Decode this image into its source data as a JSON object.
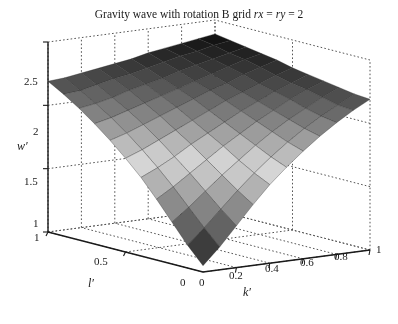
{
  "figure": {
    "width": 398,
    "height": 324,
    "background": "#ffffff",
    "title_prefix": "Gravity wave with rotation B grid ",
    "title_italic_1": "rx",
    "title_mid": " = ",
    "title_italic_2": "ry",
    "title_suffix": " = 2",
    "title_full": "Gravity wave with rotation B grid rx = ry = 2"
  },
  "chart_data": {
    "type": "surface",
    "title": "Gravity wave with rotation B grid rx = ry = 2",
    "xlabel": "k'",
    "ylabel": "l'",
    "zlabel": "w'",
    "grid": true,
    "colormap": "gray",
    "projection": "3d",
    "view": {
      "azimuth": -37.5,
      "elevation": 30
    },
    "xlim": [
      0,
      1
    ],
    "ylim": [
      0,
      1
    ],
    "zlim": [
      1,
      2.5
    ],
    "xticks": [
      0,
      0.2,
      0.4,
      0.6,
      0.8,
      1
    ],
    "xticklabels": [
      "0",
      "0.2",
      "0.4",
      "0.6",
      "0.8",
      "1"
    ],
    "yticks": [
      0,
      0.5,
      1
    ],
    "yticklabels": [
      "0",
      "0.5",
      "1"
    ],
    "zticks": [
      1,
      1.5,
      2,
      2.5
    ],
    "zticklabels": [
      "1",
      "1.5",
      "2",
      "2.5"
    ],
    "nx": 11,
    "ny": 11,
    "x": [
      0,
      0.1,
      0.2,
      0.3,
      0.4,
      0.5,
      0.6,
      0.7,
      0.8,
      0.9,
      1
    ],
    "y": [
      0,
      0.1,
      0.2,
      0.3,
      0.4,
      0.5,
      0.6,
      0.7,
      0.8,
      0.9,
      1
    ],
    "z_description": "Saddle surface: high (dark, ~2.3) at the k'=0,l'=1 and k'=1,l'=0 corners, high at back corner, low (dark, ~1.05) at the front corner k'=0,l'=0, mid-level light gray plateau across the centre.",
    "z": [
      [
        1.05,
        1.18,
        1.33,
        1.48,
        1.62,
        1.74,
        1.85,
        1.95,
        2.04,
        2.12,
        2.19
      ],
      [
        1.18,
        1.3,
        1.43,
        1.56,
        1.68,
        1.79,
        1.89,
        1.98,
        2.06,
        2.13,
        2.2
      ],
      [
        1.33,
        1.43,
        1.54,
        1.65,
        1.75,
        1.85,
        1.94,
        2.02,
        2.09,
        2.16,
        2.22
      ],
      [
        1.48,
        1.56,
        1.65,
        1.74,
        1.83,
        1.91,
        1.99,
        2.06,
        2.13,
        2.19,
        2.24
      ],
      [
        1.62,
        1.68,
        1.75,
        1.83,
        1.9,
        1.97,
        2.04,
        2.1,
        2.16,
        2.21,
        2.26
      ],
      [
        1.74,
        1.79,
        1.85,
        1.91,
        1.97,
        2.03,
        2.09,
        2.14,
        2.19,
        2.24,
        2.28
      ],
      [
        1.85,
        1.89,
        1.94,
        1.99,
        2.04,
        2.09,
        2.14,
        2.18,
        2.23,
        2.27,
        2.31
      ],
      [
        1.95,
        1.98,
        2.02,
        2.06,
        2.1,
        2.14,
        2.18,
        2.22,
        2.26,
        2.3,
        2.33
      ],
      [
        2.04,
        2.06,
        2.09,
        2.13,
        2.16,
        2.19,
        2.23,
        2.26,
        2.29,
        2.32,
        2.35
      ],
      [
        2.12,
        2.13,
        2.16,
        2.19,
        2.21,
        2.24,
        2.27,
        2.3,
        2.32,
        2.35,
        2.37
      ],
      [
        2.19,
        2.2,
        2.22,
        2.24,
        2.26,
        2.28,
        2.31,
        2.33,
        2.35,
        2.37,
        2.39
      ]
    ],
    "colors": {
      "surface_low": "#0d0d0d",
      "surface_mid": "#8a8a8a",
      "surface_high": "#d8d8d8",
      "edge": "#2b2b2b",
      "grid": "#555555",
      "axis": "#1a1a1a"
    }
  },
  "ticks": {
    "z": [
      {
        "label": "2.5",
        "left": 24,
        "top": 76
      },
      {
        "label": "2",
        "left": 33,
        "top": 126
      },
      {
        "label": "1.5",
        "left": 24,
        "top": 176
      },
      {
        "label": "1",
        "left": 33,
        "top": 218
      }
    ],
    "y": [
      {
        "label": "1",
        "left": 34,
        "top": 232
      },
      {
        "label": "0.5",
        "left": 94,
        "top": 256
      },
      {
        "label": "0",
        "left": 180,
        "top": 277
      }
    ],
    "x": [
      {
        "label": "0",
        "left": 199,
        "top": 277
      },
      {
        "label": "0.2",
        "left": 229,
        "top": 270
      },
      {
        "label": "0.4",
        "left": 265,
        "top": 263
      },
      {
        "label": "0.6",
        "left": 300,
        "top": 257
      },
      {
        "label": "0.8",
        "left": 334,
        "top": 251
      },
      {
        "label": "1",
        "left": 376,
        "top": 244
      }
    ]
  },
  "axis_names": {
    "z": "w′",
    "y": "l′",
    "x": "k′"
  }
}
